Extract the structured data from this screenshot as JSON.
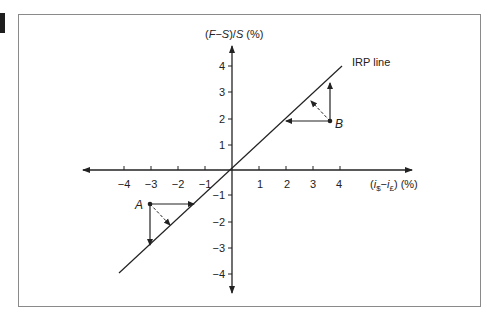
{
  "diagram": {
    "y_axis_label": {
      "prefix": "(",
      "F": "F",
      "minus": "−",
      "S1": "S",
      "slash": ")/",
      "S2": "S",
      "suffix": " (%)"
    },
    "x_axis_label": {
      "open": "(",
      "i1": "i",
      "sub1": "$",
      "minus": "−",
      "i2": "i",
      "sub2": "£",
      "close": ")",
      "unit": " (%)"
    },
    "x_ticks": [
      {
        "value": -4,
        "label": "−4"
      },
      {
        "value": -3,
        "label": "−3"
      },
      {
        "value": -2,
        "label": "−2"
      },
      {
        "value": -1,
        "label": "−1"
      },
      {
        "value": 1,
        "label": "1"
      },
      {
        "value": 2,
        "label": "2"
      },
      {
        "value": 3,
        "label": "3"
      },
      {
        "value": 4,
        "label": "4"
      }
    ],
    "y_ticks": [
      {
        "value": 4,
        "label": "4"
      },
      {
        "value": 3,
        "label": "3"
      },
      {
        "value": 2,
        "label": "2"
      },
      {
        "value": 1,
        "label": "1"
      },
      {
        "value": -1,
        "label": "−1"
      },
      {
        "value": -2,
        "label": "−2"
      },
      {
        "value": -3,
        "label": "−3"
      },
      {
        "value": -4,
        "label": "−4"
      }
    ],
    "irp_line_label": "IRP line",
    "points": [
      {
        "name": "A",
        "x": -3.0,
        "y": -1.3
      },
      {
        "name": "B",
        "x": 3.7,
        "y": 1.9
      }
    ],
    "colors": {
      "line": "#222222",
      "frame": "#8a8a8a"
    }
  }
}
